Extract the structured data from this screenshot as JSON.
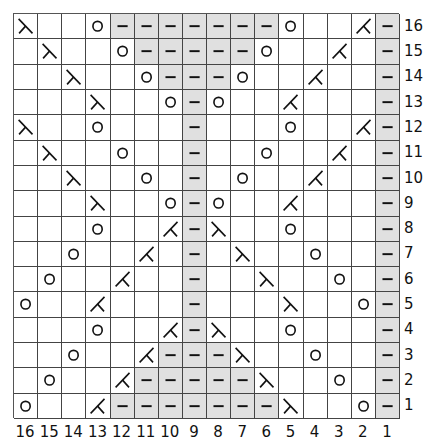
{
  "chart": {
    "columns": 16,
    "rows": 16,
    "purl_color": "#e0e0e0",
    "legend_symbols": {
      "k": "knit (blank)",
      "p": "purl (dash, gray)",
      "yo": "yarn over (circle)",
      "ssk": "ssk (left-leaning decrease)",
      "k2tog": "k2tog (right-leaning decrease)"
    },
    "column_labels": [
      "16",
      "15",
      "14",
      "13",
      "12",
      "11",
      "10",
      "9",
      "8",
      "7",
      "6",
      "5",
      "4",
      "3",
      "2",
      "1"
    ],
    "row_labels": [
      "16",
      "15",
      "14",
      "13",
      "12",
      "11",
      "10",
      "9",
      "8",
      "7",
      "6",
      "5",
      "4",
      "3",
      "2",
      "1"
    ],
    "grid": [
      [
        "ssk",
        "k",
        "k",
        "yo",
        "p",
        "p",
        "p",
        "p",
        "p",
        "p",
        "p",
        "yo",
        "k",
        "k",
        "k2tog",
        "p"
      ],
      [
        "k",
        "ssk",
        "k",
        "k",
        "yo",
        "p",
        "p",
        "p",
        "p",
        "p",
        "yo",
        "k",
        "k",
        "k2tog",
        "k",
        "p"
      ],
      [
        "k",
        "k",
        "ssk",
        "k",
        "k",
        "yo",
        "p",
        "p",
        "p",
        "yo",
        "k",
        "k",
        "k2tog",
        "k",
        "k",
        "p"
      ],
      [
        "k",
        "k",
        "k",
        "ssk",
        "k",
        "k",
        "yo",
        "p",
        "yo",
        "k",
        "k",
        "k2tog",
        "k",
        "k",
        "k",
        "p"
      ],
      [
        "ssk",
        "k",
        "k",
        "yo",
        "k",
        "k",
        "k",
        "p",
        "k",
        "k",
        "k",
        "yo",
        "k",
        "k",
        "k2tog",
        "p"
      ],
      [
        "k",
        "ssk",
        "k",
        "k",
        "yo",
        "k",
        "k",
        "p",
        "k",
        "k",
        "yo",
        "k",
        "k",
        "k2tog",
        "k",
        "p"
      ],
      [
        "k",
        "k",
        "ssk",
        "k",
        "k",
        "yo",
        "k",
        "p",
        "k",
        "yo",
        "k",
        "k",
        "k2tog",
        "k",
        "k",
        "p"
      ],
      [
        "k",
        "k",
        "k",
        "ssk",
        "k",
        "k",
        "yo",
        "p",
        "yo",
        "k",
        "k",
        "k2tog",
        "k",
        "k",
        "k",
        "p"
      ],
      [
        "k",
        "k",
        "k",
        "yo",
        "k",
        "k",
        "k2tog",
        "p",
        "ssk",
        "k",
        "k",
        "yo",
        "k",
        "k",
        "k",
        "p"
      ],
      [
        "k",
        "k",
        "yo",
        "k",
        "k",
        "k2tog",
        "k",
        "p",
        "k",
        "ssk",
        "k",
        "k",
        "yo",
        "k",
        "k",
        "p"
      ],
      [
        "k",
        "yo",
        "k",
        "k",
        "k2tog",
        "k",
        "k",
        "p",
        "k",
        "k",
        "ssk",
        "k",
        "k",
        "yo",
        "k",
        "p"
      ],
      [
        "yo",
        "k",
        "k",
        "k2tog",
        "k",
        "k",
        "k",
        "p",
        "k",
        "k",
        "k",
        "ssk",
        "k",
        "k",
        "yo",
        "p"
      ],
      [
        "k",
        "k",
        "k",
        "yo",
        "k",
        "k",
        "k2tog",
        "p",
        "ssk",
        "k",
        "k",
        "yo",
        "k",
        "k",
        "k",
        "p"
      ],
      [
        "k",
        "k",
        "yo",
        "k",
        "k",
        "k2tog",
        "p",
        "p",
        "p",
        "ssk",
        "k",
        "k",
        "yo",
        "k",
        "k",
        "p"
      ],
      [
        "k",
        "yo",
        "k",
        "k",
        "k2tog",
        "p",
        "p",
        "p",
        "p",
        "p",
        "ssk",
        "k",
        "k",
        "yo",
        "k",
        "p"
      ],
      [
        "yo",
        "k",
        "k",
        "k2tog",
        "p",
        "p",
        "p",
        "p",
        "p",
        "p",
        "p",
        "ssk",
        "k",
        "k",
        "yo",
        "p"
      ]
    ]
  }
}
